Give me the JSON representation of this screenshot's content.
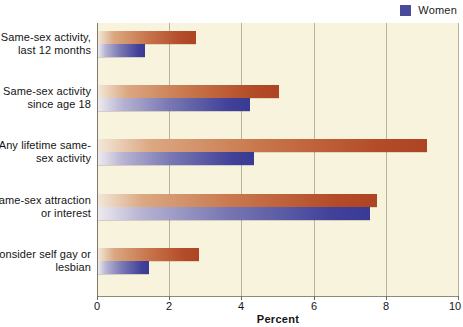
{
  "legend": {
    "position": "top-right",
    "entries": [
      {
        "label": "Women",
        "color": "#4a4a9c",
        "key": "women"
      }
    ]
  },
  "axis": {
    "xlabel": "Percent",
    "ticks": [
      "0",
      "2",
      "4",
      "6",
      "8",
      "10"
    ]
  },
  "colors": {
    "men": "#b34a28",
    "women": "#3a3a93",
    "plot_background": "#f8f3dc",
    "gridline": "#b9b29a",
    "page_background": "#ffffff"
  },
  "chart_data": {
    "type": "bar",
    "orientation": "horizontal",
    "title": "",
    "subtitle": "",
    "xlabel": "Percent",
    "ylabel": "",
    "xlim": [
      0,
      10
    ],
    "xticks": [
      0,
      2,
      4,
      6,
      8,
      10
    ],
    "grid": true,
    "legend_position": "top-right",
    "categories": [
      "Same-sex activity, last 12 months",
      "Same-sex activity since age 18",
      "Any lifetime same-sex activity",
      "Same-sex attraction or interest",
      "Consider self gay or lesbian"
    ],
    "series": [
      {
        "name": "Men",
        "color": "#b34a28",
        "values": [
          2.7,
          5.0,
          9.1,
          7.7,
          2.8
        ]
      },
      {
        "name": "Women",
        "color": "#3a3a93",
        "values": [
          1.3,
          4.2,
          4.3,
          7.5,
          1.4
        ]
      }
    ]
  },
  "category_labels": [
    {
      "line1": "Same-sex activity,",
      "line2": "last 12 months"
    },
    {
      "line1": "Same-sex activity",
      "line2": "since age 18"
    },
    {
      "line1": "Any lifetime same-",
      "line2": "sex activity"
    },
    {
      "line1": "Same-sex attraction",
      "line2": "or interest"
    },
    {
      "line1": "Consider self gay or",
      "line2": "lesbian"
    }
  ]
}
